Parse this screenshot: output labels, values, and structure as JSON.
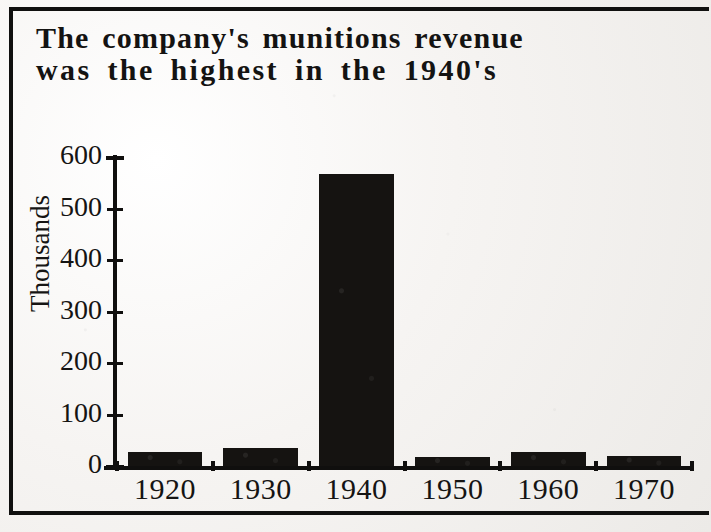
{
  "figure": {
    "title_line1": "The company's munitions revenue",
    "title_line2": "was the highest in the 1940's",
    "border_color": "#10100f",
    "bar_color": "#151311",
    "background_color": "#f2f0ee"
  },
  "chart_data": {
    "type": "bar",
    "title": "The company's munitions revenue was the highest in the 1940's",
    "categories": [
      "1920",
      "1930",
      "1940",
      "1950",
      "1960",
      "1970"
    ],
    "values": [
      27,
      35,
      567,
      17,
      27,
      20
    ],
    "xlabel": "",
    "ylabel": "Thousands",
    "ylim": [
      0,
      600
    ],
    "yticks": [
      0,
      100,
      200,
      300,
      400,
      500,
      600
    ],
    "ytick_labels": [
      "0",
      "100",
      "200",
      "300",
      "400",
      "500",
      "600"
    ],
    "grid": false,
    "legend": false,
    "series": [
      {
        "name": "Munitions revenue",
        "values": [
          27,
          35,
          567,
          17,
          27,
          20
        ]
      }
    ]
  }
}
